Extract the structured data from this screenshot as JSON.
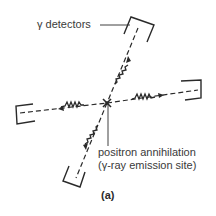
{
  "diagram": {
    "labels": {
      "detectors": "γ detectors",
      "annihilation_line1": "positron annihilation",
      "annihilation_line2": "(γ-ray emission site)"
    },
    "caption": "(a)",
    "colors": {
      "ink": "#2a2a2a",
      "text": "#3a3a3a",
      "background": "#ffffff"
    },
    "elements": {
      "center": {
        "x": 107,
        "y": 103
      },
      "detectors": [
        "top-right",
        "right",
        "bottom-left",
        "left"
      ],
      "gamma_rays": [
        "up-right",
        "right",
        "down-left",
        "left"
      ]
    }
  }
}
